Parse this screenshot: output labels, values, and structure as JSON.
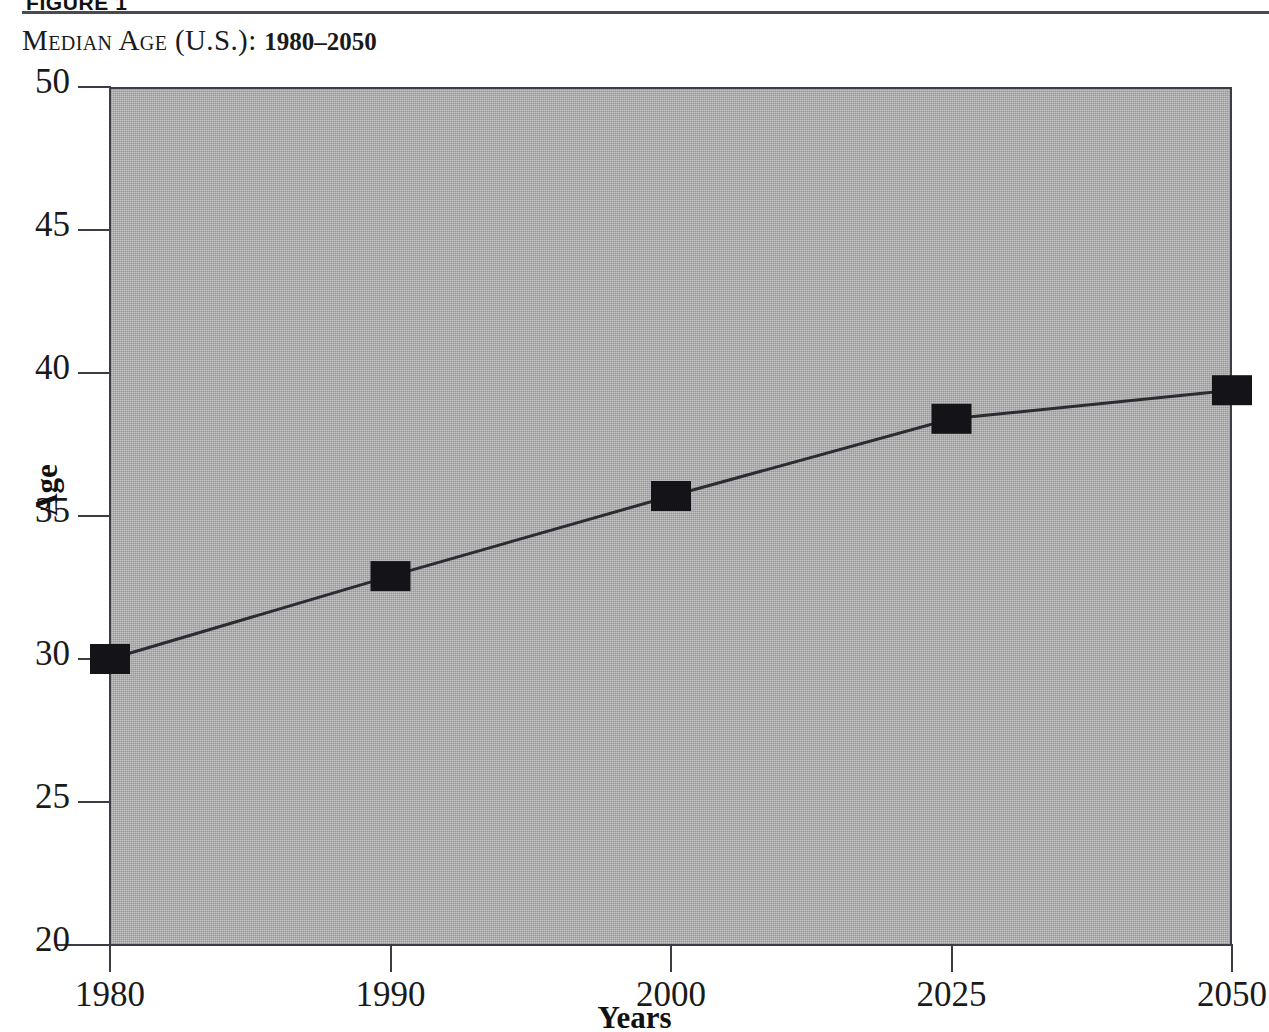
{
  "figure": {
    "label": "FIGURE 1",
    "title_main": "Median Age (U.S.)",
    "title_sep": ": ",
    "title_range": "1980–2050"
  },
  "chart_data": {
    "type": "line",
    "title": "MEDIAN AGE (U.S.): 1980–2050",
    "xlabel": "Years",
    "ylabel": "Age",
    "categories": [
      "1980",
      "1990",
      "2000",
      "2025",
      "2050"
    ],
    "values": [
      30.0,
      32.9,
      35.7,
      38.4,
      39.4
    ],
    "series": [
      {
        "name": "Median Age",
        "values": [
          30.0,
          32.9,
          35.7,
          38.4,
          39.4
        ]
      }
    ],
    "ylim": [
      20,
      50
    ],
    "yticks": [
      20,
      25,
      30,
      35,
      40,
      45,
      50
    ],
    "ytick_labels": [
      "20",
      "25",
      "30",
      "35",
      "40",
      "45",
      "50"
    ],
    "xtick_labels": [
      "1980",
      "1990",
      "2000",
      "2025",
      "2050"
    ],
    "grid": false,
    "legend": "none",
    "marker": "square",
    "marker_color": "#141418",
    "line_color": "#2b2b32",
    "plot_background": "#a9a9a9",
    "axis_color": "#3c3c44"
  }
}
